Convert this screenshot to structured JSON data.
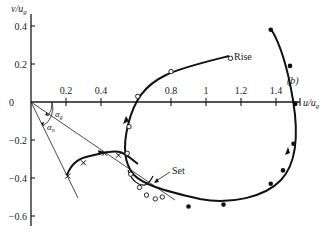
{
  "figure": {
    "panel_label": "(b)",
    "x_axis": {
      "label": "u/u",
      "label_sub": "g",
      "ticks": [
        {
          "value": 0.2,
          "label": "0.2"
        },
        {
          "value": 0.4,
          "label": "0.4"
        },
        {
          "value": 0.8,
          "label": "0.8"
        },
        {
          "value": 1.0,
          "label": "1"
        },
        {
          "value": 1.2,
          "label": "1.2"
        },
        {
          "value": 1.4,
          "label": "1.4"
        }
      ],
      "range": [
        0,
        1.55
      ]
    },
    "y_axis": {
      "label": "v/u",
      "label_sub": "g",
      "ticks": [
        {
          "value": 0.4,
          "label": "0.4"
        },
        {
          "value": 0.2,
          "label": "0.2"
        },
        {
          "value": 0,
          "label": "0"
        },
        {
          "value": -0.2,
          "label": "−0.2"
        },
        {
          "value": -0.4,
          "label": "−0.4"
        },
        {
          "value": -0.6,
          "label": "−0.6"
        }
      ],
      "range": [
        -0.7,
        0.45
      ]
    },
    "annotations": {
      "rise": "Rise",
      "set": "Set",
      "alpha_g": "α",
      "alpha_g_sub": "g",
      "alpha_n": "α",
      "alpha_n_sub": "n"
    },
    "hodograph_open": [
      [
        1.14,
        0.23
      ],
      [
        0.8,
        0.16
      ],
      [
        0.61,
        0.03
      ],
      [
        0.56,
        -0.13
      ],
      [
        0.55,
        -0.27
      ],
      [
        0.57,
        -0.38
      ],
      [
        0.62,
        -0.45
      ],
      [
        0.66,
        -0.49
      ],
      [
        0.71,
        -0.51
      ],
      [
        0.75,
        -0.5
      ]
    ],
    "hodograph_filled": [
      [
        1.37,
        0.38
      ],
      [
        1.48,
        0.19
      ],
      [
        1.51,
        -0.01
      ],
      [
        1.5,
        -0.22
      ],
      [
        1.44,
        -0.36
      ],
      [
        1.37,
        -0.43
      ],
      [
        1.1,
        -0.54
      ],
      [
        0.9,
        -0.55
      ]
    ],
    "hodograph_cross": [
      [
        0.21,
        -0.39
      ],
      [
        0.3,
        -0.32
      ],
      [
        0.42,
        -0.27
      ],
      [
        0.5,
        -0.28
      ]
    ]
  }
}
